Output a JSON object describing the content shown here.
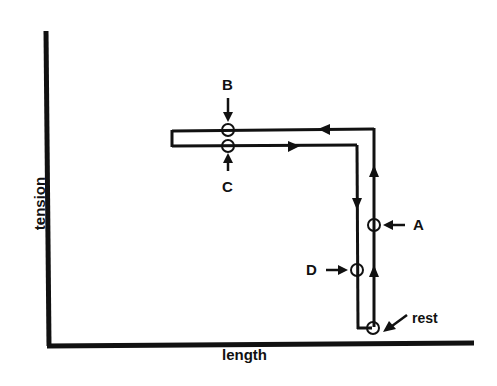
{
  "diagram": {
    "axes": {
      "x_label": "length",
      "y_label": "tension"
    },
    "points": {
      "A": {
        "label": "A"
      },
      "B": {
        "label": "B"
      },
      "C": {
        "label": "C"
      },
      "D": {
        "label": "D"
      },
      "rest": {
        "label": "rest"
      }
    },
    "colors": {
      "ink": "#111111",
      "background": "#ffffff"
    }
  }
}
